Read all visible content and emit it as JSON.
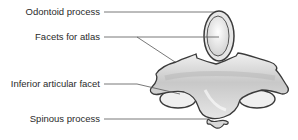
{
  "figure": {
    "labels": [
      {
        "id": "odontoid",
        "text": "Odontoid process"
      },
      {
        "id": "facets-atlas",
        "text": "Facets for atlas"
      },
      {
        "id": "inferior-facet",
        "text": "Inferior articular facet"
      },
      {
        "id": "spinous",
        "text": "Spinous process"
      }
    ]
  },
  "colors": {
    "bone_fill": "#d9d9d9",
    "bone_shadow": "#b5b5b5",
    "bone_highlight": "#f2f2f2",
    "outline": "#3a3a3a",
    "leader_line": "#555555",
    "text": "#2a2a2a"
  }
}
